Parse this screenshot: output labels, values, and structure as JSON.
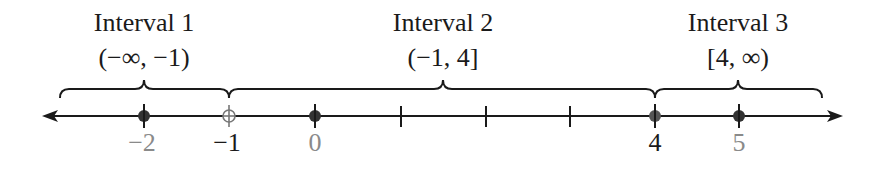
{
  "intervals": [
    {
      "title": "Interval 1",
      "notation": "(−∞, −1)",
      "center_x": 144
    },
    {
      "title": "Interval 2",
      "notation": "(−1, 4]",
      "center_x": 443
    },
    {
      "title": "Interval 3",
      "notation": "[4, ∞)",
      "center_x": 738
    }
  ],
  "tick_labels": [
    {
      "text": "−2",
      "value": -2,
      "x": 144,
      "color": "#8a8a8a"
    },
    {
      "text": "−1",
      "value": -1,
      "x": 229,
      "color": "#1a1a1a"
    },
    {
      "text": "0",
      "value": 0,
      "x": 315,
      "color": "#8a8a8a"
    },
    {
      "text": "4",
      "value": 4,
      "x": 655,
      "color": "#1a1a1a"
    },
    {
      "text": "5",
      "value": 5,
      "x": 739,
      "color": "#8a8a8a"
    }
  ],
  "points": [
    {
      "value": -2,
      "style": "filled"
    },
    {
      "value": -1,
      "style": "open"
    },
    {
      "value": 0,
      "style": "filled"
    },
    {
      "value": 4,
      "style": "filled"
    },
    {
      "value": 5,
      "style": "filled"
    }
  ],
  "unlabeled_ticks": [
    1,
    2,
    3
  ],
  "colors": {
    "line": "#1a1a1a",
    "muted": "#8a8a8a",
    "point": "#333333"
  }
}
